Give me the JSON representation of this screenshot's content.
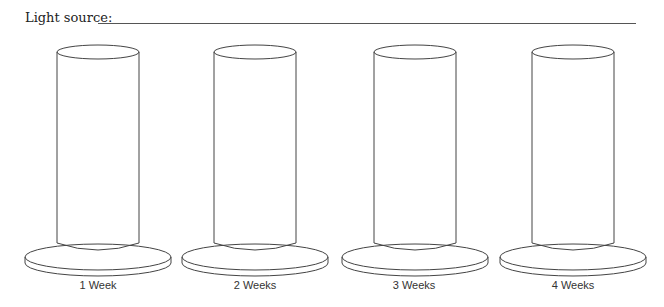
{
  "header": {
    "label": "Light source:"
  },
  "cylinders": [
    {
      "label": "1 Week"
    },
    {
      "label": "2 Weeks"
    },
    {
      "label": "3 Weeks"
    },
    {
      "label": "4 Weeks"
    }
  ]
}
